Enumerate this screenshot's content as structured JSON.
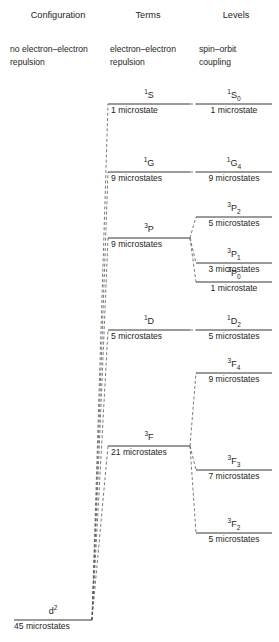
{
  "figure": {
    "type": "energy-level-diagram",
    "colors": {
      "text": "#231f20",
      "line": "#231f20",
      "dashed": "#58595b"
    }
  },
  "columns": {
    "configuration": {
      "heading": "Configuration",
      "subheading_line1": "no electron–electron",
      "subheading_line2": "repulsion"
    },
    "terms": {
      "heading": "Terms",
      "subheading_line1": "electron–electron",
      "subheading_line2": "repulsion"
    },
    "levels": {
      "heading": "Levels",
      "subheading_line1": "spin–orbit",
      "subheading_line2": "coupling"
    }
  },
  "configuration_state": {
    "symbol_pre": "d",
    "symbol_sup": "2",
    "microstates": "45 microstates",
    "microstate_count": 45
  },
  "terms": [
    {
      "id": "1S",
      "sup": "1",
      "letter": "S",
      "microstates": "1 microstate",
      "microstate_count": 1
    },
    {
      "id": "1G",
      "sup": "1",
      "letter": "G",
      "microstates": "9 microstates",
      "microstate_count": 9
    },
    {
      "id": "3P",
      "sup": "3",
      "letter": "P",
      "microstates": "9 microstates",
      "microstate_count": 9
    },
    {
      "id": "1D",
      "sup": "1",
      "letter": "D",
      "microstates": "5 microstates",
      "microstate_count": 5
    },
    {
      "id": "3F",
      "sup": "3",
      "letter": "F",
      "microstates": "21 microstates",
      "microstate_count": 21
    }
  ],
  "levels": [
    {
      "id": "1S0",
      "sup": "1",
      "letter": "S",
      "sub": "0",
      "microstates": "1 microstate",
      "microstate_count": 1,
      "parent": "1S"
    },
    {
      "id": "1G4",
      "sup": "1",
      "letter": "G",
      "sub": "4",
      "microstates": "9 microstates",
      "microstate_count": 9,
      "parent": "1G"
    },
    {
      "id": "3P2",
      "sup": "3",
      "letter": "P",
      "sub": "2",
      "microstates": "5 microstates",
      "microstate_count": 5,
      "parent": "3P"
    },
    {
      "id": "3P1",
      "sup": "3",
      "letter": "P",
      "sub": "1",
      "microstates": "3 microstates",
      "microstate_count": 3,
      "parent": "3P"
    },
    {
      "id": "3P0",
      "sup": "3",
      "letter": "P",
      "sub": "0",
      "microstates": "1 microstate",
      "microstate_count": 1,
      "parent": "3P"
    },
    {
      "id": "1D2",
      "sup": "1",
      "letter": "D",
      "sub": "2",
      "microstates": "5 microstates",
      "microstate_count": 5,
      "parent": "1D"
    },
    {
      "id": "3F4",
      "sup": "3",
      "letter": "F",
      "sub": "4",
      "microstates": "9 microstates",
      "microstate_count": 9,
      "parent": "3F"
    },
    {
      "id": "3F3",
      "sup": "3",
      "letter": "F",
      "sub": "3",
      "microstates": "7 microstates",
      "microstate_count": 7,
      "parent": "3F"
    },
    {
      "id": "3F2",
      "sup": "3",
      "letter": "F",
      "sub": "2",
      "microstates": "5 microstates",
      "microstate_count": 5,
      "parent": "3F"
    }
  ]
}
